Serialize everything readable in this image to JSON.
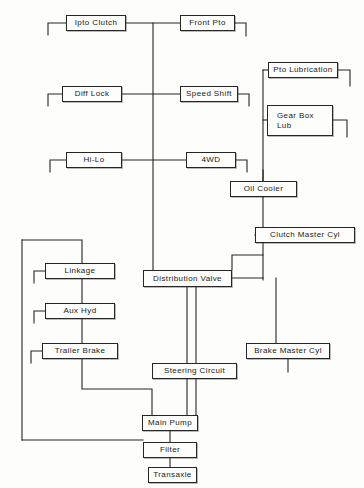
{
  "diagram": {
    "line_color": "#262626",
    "box_fill": "#fdfdfb",
    "text_color": "#1a1a1a",
    "nodes": [
      {
        "id": "ipto-clutch",
        "label": "Ipto Clutch",
        "x": 66,
        "y": 15,
        "w": 60,
        "h": 16,
        "lines": 1
      },
      {
        "id": "front-pto",
        "label": "Front Pto",
        "x": 180,
        "y": 15,
        "w": 55,
        "h": 16,
        "lines": 1
      },
      {
        "id": "pto-lubrication",
        "label": "Pto Lubrication",
        "x": 268,
        "y": 62,
        "w": 70,
        "h": 16,
        "lines": 1
      },
      {
        "id": "diff-lock",
        "label": "Diff Lock",
        "x": 62,
        "y": 86,
        "w": 60,
        "h": 16,
        "lines": 1
      },
      {
        "id": "speed-shift",
        "label": "Speed Shift",
        "x": 180,
        "y": 86,
        "w": 58,
        "h": 16,
        "lines": 1
      },
      {
        "id": "gear-box-lub",
        "label": "Gear Box\nLub",
        "x": 267,
        "y": 105,
        "w": 66,
        "h": 31,
        "lines": 2
      },
      {
        "id": "hi-lo",
        "label": "Hi-Lo",
        "x": 66,
        "y": 152,
        "w": 56,
        "h": 16,
        "lines": 1
      },
      {
        "id": "four-wd",
        "label": "4WD",
        "x": 186,
        "y": 152,
        "w": 50,
        "h": 16,
        "lines": 1
      },
      {
        "id": "oil-cooler",
        "label": "Oil Cooler",
        "x": 230,
        "y": 181,
        "w": 67,
        "h": 16,
        "lines": 1
      },
      {
        "id": "clutch-master-cyl",
        "label": "Clutch Master Cyl",
        "x": 255,
        "y": 227,
        "w": 100,
        "h": 16,
        "lines": 1
      },
      {
        "id": "linkage",
        "label": "Linkage",
        "x": 45,
        "y": 263,
        "w": 70,
        "h": 16,
        "lines": 1
      },
      {
        "id": "distribution-valve",
        "label": "Distribution Valve",
        "x": 143,
        "y": 270,
        "w": 89,
        "h": 17,
        "lines": 1
      },
      {
        "id": "aux-hyd",
        "label": "Aux Hyd",
        "x": 45,
        "y": 303,
        "w": 70,
        "h": 16,
        "lines": 1
      },
      {
        "id": "trailer-brake",
        "label": "Trailer Brake",
        "x": 42,
        "y": 343,
        "w": 76,
        "h": 16,
        "lines": 1
      },
      {
        "id": "brake-master-cyl",
        "label": "Brake Master Cyl",
        "x": 246,
        "y": 343,
        "w": 84,
        "h": 16,
        "lines": 1
      },
      {
        "id": "steering-circuit",
        "label": "Steering Circuit",
        "x": 152,
        "y": 363,
        "w": 85,
        "h": 16,
        "lines": 1
      },
      {
        "id": "main-pump",
        "label": "Main Pump",
        "x": 142,
        "y": 415,
        "w": 56,
        "h": 16,
        "lines": 1
      },
      {
        "id": "filter",
        "label": "Filter",
        "x": 143,
        "y": 442,
        "w": 54,
        "h": 16,
        "lines": 1
      },
      {
        "id": "transaxle",
        "label": "Transaxle",
        "x": 148,
        "y": 467,
        "w": 49,
        "h": 16,
        "lines": 1
      }
    ],
    "connectors": [
      {
        "id": "ipto-to-trunk",
        "points": "126,23 235,23"
      },
      {
        "id": "ipto-ground-stub",
        "points": "66,23 48,23 48,35"
      },
      {
        "id": "front-pto-ground-stub",
        "points": "235,23 246,23 246,36"
      },
      {
        "id": "trunk-main-vertical",
        "points": "153,23 153,275"
      },
      {
        "id": "diff-to-speed",
        "points": "122,94 180,94"
      },
      {
        "id": "diff-ground-stub",
        "points": "62,94 48,94 48,106"
      },
      {
        "id": "speed-ground-stub",
        "points": "238,94 249,94 249,106"
      },
      {
        "id": "hilo-to-4wd",
        "points": "122,160 186,160"
      },
      {
        "id": "hilo-ground-stub",
        "points": "66,160 50,160 50,172"
      },
      {
        "id": "fourwd-ground-stub",
        "points": "236,160 247,160 247,172"
      },
      {
        "id": "pto-lub-ground-stub",
        "points": "338,70 350,70 350,86"
      },
      {
        "id": "gearbox-lub-ground-stub",
        "points": "333,120 347,120 347,137"
      },
      {
        "id": "right-riser",
        "points": "263,197 263,70"
      },
      {
        "id": "right-riser-to-ptolub",
        "points": "263,70 268,70"
      },
      {
        "id": "right-riser-to-gearbox",
        "points": "263,120 267,120"
      },
      {
        "id": "oilcooler-top-stub",
        "points": "263,181 263,170"
      },
      {
        "id": "oilcooler-down",
        "points": "263,197 263,280"
      },
      {
        "id": "clutch-master-feed",
        "points": "263,235 255,235"
      },
      {
        "id": "distrib-to-right",
        "points": "232,278 263,278"
      },
      {
        "id": "distrib-upper-loop",
        "points": "232,270 232,255 263,255"
      },
      {
        "id": "distrib-down",
        "points": "187,287 187,415"
      },
      {
        "id": "brake-master-riser",
        "points": "276,278 276,343"
      },
      {
        "id": "brake-master-ground",
        "points": "288,359 288,372"
      },
      {
        "id": "steering-from-trunk",
        "points": "196,287 196,363"
      },
      {
        "id": "steering-to-pump",
        "points": "196,379 196,415"
      },
      {
        "id": "left-bus-vertical",
        "points": "22,240 22,440"
      },
      {
        "id": "left-bus-top",
        "points": "22,240 82,240 82,263"
      },
      {
        "id": "linkage-ground",
        "points": "45,271 34,271 34,283"
      },
      {
        "id": "aux-ground",
        "points": "45,311 34,311 34,323"
      },
      {
        "id": "trailer-ground",
        "points": "42,351 31,351 31,363"
      },
      {
        "id": "linkage-to-aux",
        "points": "82,279 82,303"
      },
      {
        "id": "aux-to-trailer",
        "points": "82,319 82,343"
      },
      {
        "id": "trailer-to-pumpbus",
        "points": "82,359 82,389 152,389 152,415"
      },
      {
        "id": "leftbus-to-filter",
        "points": "22,440 143,440"
      },
      {
        "id": "pump-to-filter",
        "points": "170,431 170,442"
      },
      {
        "id": "filter-to-transaxle",
        "points": "170,458 170,467"
      }
    ]
  }
}
